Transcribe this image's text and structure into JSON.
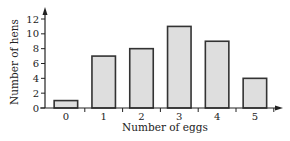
{
  "chart_data": {
    "type": "bar",
    "title": "",
    "xlabel": "Number of eggs",
    "ylabel": "Number of hens",
    "categories": [
      "0",
      "1",
      "2",
      "3",
      "4",
      "5"
    ],
    "values": [
      1,
      7,
      8,
      11,
      9,
      4
    ],
    "ylim": [
      0,
      12
    ],
    "yticks": [
      0,
      2,
      4,
      6,
      8,
      10,
      12
    ],
    "grid": false,
    "legend": null,
    "bar_fill": "#dedede",
    "bar_stroke": "#333333"
  }
}
